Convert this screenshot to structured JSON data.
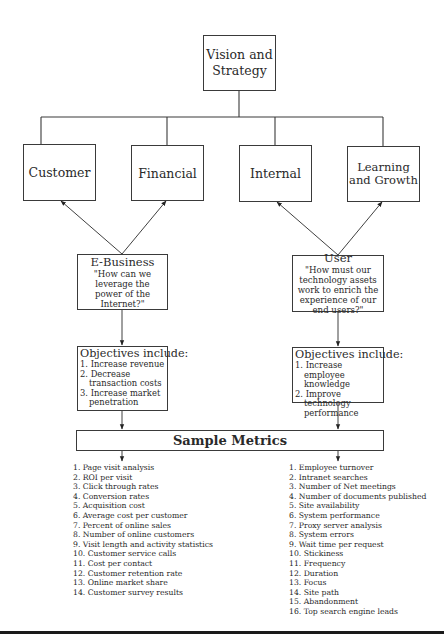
{
  "root": {
    "line1": "Vision and",
    "line2": "Strategy"
  },
  "perspectives": [
    {
      "id": "customer",
      "label": "Customer"
    },
    {
      "id": "financial",
      "label": "Financial"
    },
    {
      "id": "internal",
      "label": "Internal"
    },
    {
      "id": "learning",
      "line1": "Learning",
      "line2": "and Growth"
    }
  ],
  "themes": {
    "left": {
      "title": "E-Business",
      "question": "\"How can we leverage the power of the Internet?\""
    },
    "right": {
      "title": "User",
      "question": "\"How must our technology assets work to enrich the experience of our end users?\""
    }
  },
  "objectives": {
    "left": {
      "title": "Objectives include:",
      "items": [
        "1. Increase revenue",
        "2. Decrease transaction costs",
        "3. Increase market penetration"
      ]
    },
    "right": {
      "title": "Objectives include:",
      "items": [
        "1. Increase employee knowledge",
        "2. Improve technology performance"
      ]
    }
  },
  "sample_metrics": {
    "title": "Sample Metrics",
    "left": [
      "1. Page visit analysis",
      "2. ROI per visit",
      "3. Click through rates",
      "4. Conversion rates",
      "5. Acquisition cost",
      "6. Average cost per customer",
      "7. Percent of online sales",
      "8. Number of online customers",
      "9. Visit length and activity statistics",
      "10. Customer service calls",
      "11. Cost per contact",
      "12. Customer retention rate",
      "13. Online market share",
      "14. Customer survey results"
    ],
    "right": [
      "1. Employee turnover",
      "2. Intranet searches",
      "3. Number of Net meetings",
      "4. Number of documents published",
      "5. Site availability",
      "6. System performance",
      "7. Proxy server analysis",
      "8. System errors",
      "9. Wait time per request",
      "10. Stickiness",
      "11. Frequency",
      "12. Duration",
      "13. Focus",
      "14. Site path",
      "15. Abandonment",
      "16. Top search engine leads"
    ]
  }
}
